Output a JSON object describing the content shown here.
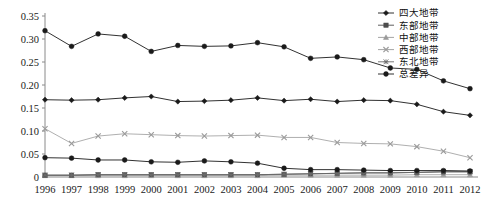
{
  "chart_data": {
    "type": "line",
    "title": "",
    "xlabel": "",
    "ylabel": "",
    "categories": [
      "1996",
      "1997",
      "1998",
      "1999",
      "2000",
      "2001",
      "2002",
      "2003",
      "2004",
      "2005",
      "2006",
      "2007",
      "2008",
      "2009",
      "2010",
      "2011",
      "2012"
    ],
    "ylim": [
      0,
      0.35
    ],
    "ytick_labels": [
      "0.35",
      "0.30",
      "0.25",
      "0.20",
      "0.15",
      "0.10",
      "0.05",
      "0"
    ],
    "ytick_values": [
      0.35,
      0.3,
      0.25,
      0.2,
      0.15,
      0.1,
      0.05,
      0
    ],
    "grid": false,
    "legend_position": "top-right",
    "series": [
      {
        "name": "四大地带",
        "marker": "diamond",
        "color": "#1a1a1a",
        "values": [
          0.168,
          0.167,
          0.168,
          0.172,
          0.175,
          0.164,
          0.165,
          0.167,
          0.172,
          0.166,
          0.169,
          0.164,
          0.167,
          0.166,
          0.158,
          0.142,
          0.134
        ]
      },
      {
        "name": "东部地带",
        "marker": "square",
        "color": "#4d4d4d",
        "values": [
          0.004,
          0.004,
          0.005,
          0.005,
          0.005,
          0.005,
          0.005,
          0.005,
          0.005,
          0.006,
          0.007,
          0.008,
          0.009,
          0.009,
          0.01,
          0.011,
          0.011
        ]
      },
      {
        "name": "中部地带",
        "marker": "triangle",
        "color": "#9a9a9a",
        "values": [
          0.003,
          0.003,
          0.003,
          0.003,
          0.003,
          0.003,
          0.003,
          0.003,
          0.003,
          0.004,
          0.004,
          0.004,
          0.004,
          0.004,
          0.005,
          0.005,
          0.005
        ]
      },
      {
        "name": "西部地带",
        "marker": "cross",
        "color": "#9a9a9a",
        "values": [
          0.105,
          0.073,
          0.089,
          0.094,
          0.092,
          0.09,
          0.089,
          0.09,
          0.091,
          0.086,
          0.086,
          0.075,
          0.073,
          0.072,
          0.066,
          0.056,
          0.042
        ]
      },
      {
        "name": "东北地带",
        "marker": "asterisk",
        "color": "#6b6b6b",
        "values": [
          0.004,
          0.004,
          0.005,
          0.005,
          0.005,
          0.005,
          0.005,
          0.005,
          0.005,
          0.006,
          0.007,
          0.008,
          0.009,
          0.009,
          0.01,
          0.012,
          0.012
        ]
      },
      {
        "name": "总差异",
        "marker": "circle",
        "color": "#1a1a1a",
        "values": [
          0.042,
          0.041,
          0.037,
          0.037,
          0.033,
          0.032,
          0.035,
          0.033,
          0.03,
          0.019,
          0.016,
          0.016,
          0.015,
          0.014,
          0.014,
          0.014,
          0.013
        ]
      }
    ],
    "top_series": {
      "name": "总差异",
      "values": [
        0.318,
        0.284,
        0.311,
        0.306,
        0.273,
        0.286,
        0.284,
        0.285,
        0.292,
        0.283,
        0.258,
        0.261,
        0.255,
        0.237,
        0.234,
        0.209,
        0.192
      ]
    }
  }
}
